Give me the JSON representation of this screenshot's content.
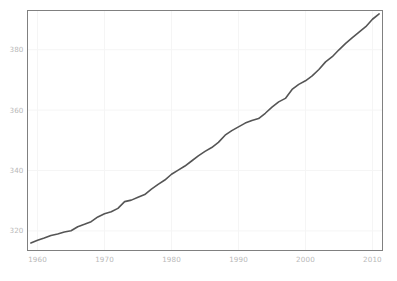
{
  "chart_data": {
    "type": "line",
    "title": "",
    "subtitle": "",
    "xlabel": "",
    "ylabel": "",
    "xlim": [
      1958.5,
      2011.5
    ],
    "ylim": [
      313.5,
      393.0
    ],
    "xticks": [
      1960,
      1970,
      1980,
      1990,
      2000,
      2010
    ],
    "xtick_labels": [
      "1960",
      "1970",
      "1980",
      "1990",
      "2000",
      "2010"
    ],
    "yticks": [
      320,
      340,
      360,
      380
    ],
    "ytick_labels": [
      "320",
      "340",
      "360",
      "380"
    ],
    "grid": true,
    "legend": null,
    "annotations": [],
    "series": [
      {
        "name": "Atmospheric CO2 concentration",
        "color": "#555555",
        "x": [
          1959,
          1960,
          1961,
          1962,
          1963,
          1964,
          1965,
          1966,
          1967,
          1968,
          1969,
          1970,
          1971,
          1972,
          1973,
          1974,
          1975,
          1976,
          1977,
          1978,
          1979,
          1980,
          1981,
          1982,
          1983,
          1984,
          1985,
          1986,
          1987,
          1988,
          1989,
          1990,
          1991,
          1992,
          1993,
          1994,
          1995,
          1996,
          1997,
          1998,
          1999,
          2000,
          2001,
          2002,
          2003,
          2004,
          2005,
          2006,
          2007,
          2008,
          2009,
          2010,
          2011
        ],
        "values": [
          315.97,
          316.91,
          317.64,
          318.45,
          318.99,
          319.62,
          320.04,
          321.37,
          322.18,
          323.05,
          324.62,
          325.68,
          326.32,
          327.46,
          329.68,
          330.19,
          331.12,
          332.03,
          333.84,
          335.41,
          336.84,
          338.76,
          340.12,
          341.48,
          343.15,
          344.85,
          346.35,
          347.61,
          349.31,
          351.69,
          353.2,
          354.45,
          355.7,
          356.54,
          357.21,
          358.96,
          360.97,
          362.74,
          363.88,
          366.84,
          368.54,
          369.71,
          371.32,
          373.45,
          375.98,
          377.7,
          379.98,
          382.09,
          384.02,
          385.83,
          387.64,
          390.1,
          391.85
        ]
      }
    ]
  },
  "axes": {
    "frame_color": "#808080",
    "grid_color": "#f5f5f5",
    "tick_label_color": "#b9b9b9"
  },
  "caption": {
    "text": ""
  }
}
